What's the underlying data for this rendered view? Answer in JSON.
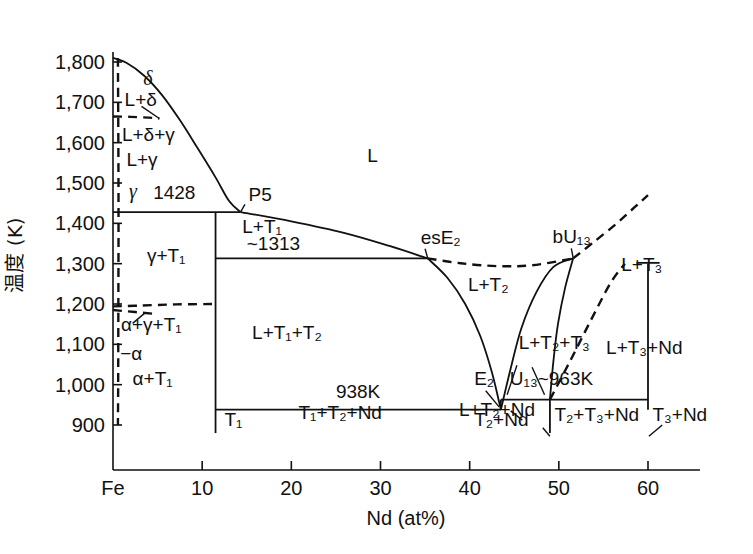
{
  "figure": {
    "kind": "binary-phase-diagram",
    "system": "Fe-Nd"
  },
  "axes": {
    "y": {
      "title": "温度 (K)",
      "unit": "K",
      "ticks": [
        900,
        1000,
        1100,
        1200,
        1300,
        1400,
        1500,
        1600,
        1700,
        1800
      ],
      "tick_labels": [
        "900",
        "1,000",
        "1,100",
        "1,200",
        "1,300",
        "1,400",
        "1,500",
        "1,600",
        "1,700",
        "1,800"
      ],
      "range": [
        855,
        1845
      ]
    },
    "x": {
      "title": "Nd (at%)",
      "ticks": [
        0,
        10,
        20,
        30,
        40,
        50,
        60
      ],
      "tick_labels": [
        "Fe",
        "10",
        "20",
        "30",
        "40",
        "50",
        "60"
      ],
      "range": [
        0,
        63.5
      ]
    }
  },
  "chart_data": {
    "type": "line",
    "xlabel": "Nd (at%)",
    "ylabel": "温度 (K)",
    "xlim": [
      0,
      63.5
    ],
    "ylim": [
      855,
      1845
    ],
    "grid": false,
    "legend": "none",
    "invariant_temperatures": [
      {
        "label": "1428",
        "value_K": 1428
      },
      {
        "label": "~1313",
        "value_K": 1313
      },
      {
        "label": "938K",
        "value_K": 938
      },
      {
        "label": "U13~963K",
        "value_K": 963
      }
    ],
    "invariant_points": [
      {
        "name": "P5",
        "x_at_pct": 14.3,
        "T_K": 1428
      },
      {
        "name": "esE2",
        "x_at_pct": 35.3,
        "T_K": 1313
      },
      {
        "name": "bU13",
        "x_at_pct": 51.6,
        "T_K": 1313
      },
      {
        "name": "E2",
        "x_at_pct": 43.5,
        "T_K": 938
      },
      {
        "name": "U13",
        "x_at_pct": 49.0,
        "T_K": 963
      }
    ],
    "series": [
      {
        "name": "liquidus-Fe-rich",
        "style": "solid",
        "points": [
          [
            0,
            1810
          ],
          [
            1.5,
            1798
          ],
          [
            3.5,
            1766
          ],
          [
            5.5,
            1718
          ],
          [
            7.5,
            1656
          ],
          [
            9.5,
            1586
          ],
          [
            11.5,
            1514
          ],
          [
            13.0,
            1456
          ],
          [
            14.3,
            1428
          ]
        ]
      },
      {
        "name": "liquidus-L+T1",
        "style": "solid",
        "points": [
          [
            14.3,
            1428
          ],
          [
            20,
            1405
          ],
          [
            26,
            1376
          ],
          [
            31,
            1344
          ],
          [
            35.3,
            1313
          ]
        ]
      },
      {
        "name": "liquidus-L+T2-left",
        "style": "solid",
        "points": [
          [
            35.3,
            1313
          ],
          [
            37.5,
            1265
          ],
          [
            39.5,
            1200
          ],
          [
            41.2,
            1120
          ],
          [
            42.5,
            1030
          ],
          [
            43.5,
            938
          ]
        ]
      },
      {
        "name": "liquidus-T2-right",
        "style": "solid",
        "points": [
          [
            43.5,
            938
          ],
          [
            44.6,
            1040
          ],
          [
            45.8,
            1140
          ],
          [
            47.5,
            1230
          ],
          [
            49.4,
            1292
          ],
          [
            51.6,
            1313
          ]
        ]
      },
      {
        "name": "T2-solvus-right",
        "style": "solid",
        "points": [
          [
            51.6,
            1313
          ],
          [
            50.7,
            1240
          ],
          [
            49.9,
            1150
          ],
          [
            49.4,
            1060
          ],
          [
            49.0,
            963
          ]
        ]
      },
      {
        "name": "solvus-esE2-bU13-dashed",
        "style": "dashed",
        "points": [
          [
            35.3,
            1313
          ],
          [
            39,
            1301
          ],
          [
            43,
            1294
          ],
          [
            47,
            1296
          ],
          [
            51.6,
            1313
          ]
        ]
      },
      {
        "name": "T3-liquidus-dashed",
        "style": "dashed",
        "points": [
          [
            51.6,
            1313
          ],
          [
            54,
            1355
          ],
          [
            56.5,
            1400
          ],
          [
            58.5,
            1440
          ],
          [
            60,
            1470
          ]
        ]
      },
      {
        "name": "T3-boundary-dashed",
        "style": "dashed",
        "points": [
          [
            49.0,
            963
          ],
          [
            51.3,
            1060
          ],
          [
            53.6,
            1160
          ],
          [
            55.8,
            1252
          ],
          [
            57.4,
            1300
          ]
        ]
      },
      {
        "name": "delta-gamma-dashed",
        "style": "dashed",
        "points": [
          [
            0,
            1665
          ],
          [
            2.0,
            1664
          ],
          [
            4.0,
            1662
          ],
          [
            5.2,
            1660
          ]
        ]
      },
      {
        "name": "alpha-gamma-dashed",
        "style": "dashed",
        "points": [
          [
            0,
            1194
          ],
          [
            3,
            1196
          ],
          [
            7,
            1199
          ],
          [
            11.5,
            1200
          ]
        ]
      },
      {
        "name": "alpha-gamma-T1-dashed",
        "style": "dashed",
        "points": [
          [
            0,
            1185
          ],
          [
            2.5,
            1180
          ],
          [
            4.5,
            1176
          ]
        ]
      },
      {
        "name": "Fe-solubility-dashed",
        "style": "dashed",
        "points": [
          [
            0.55,
            1810
          ],
          [
            0.6,
            1600
          ],
          [
            0.62,
            1400
          ],
          [
            0.6,
            1200
          ],
          [
            0.58,
            1000
          ],
          [
            0.55,
            900
          ]
        ]
      },
      {
        "name": "T3-vertical-solid",
        "style": "solid",
        "points": [
          [
            60,
            1300
          ],
          [
            60,
            938
          ]
        ]
      },
      {
        "name": "T1-vertical-solid",
        "style": "solid",
        "points": [
          [
            11.5,
            1428
          ],
          [
            11.5,
            880
          ]
        ]
      },
      {
        "name": "T2-vertical-solid",
        "style": "solid",
        "points": [
          [
            49.0,
            963
          ],
          [
            49.0,
            880
          ]
        ]
      },
      {
        "name": "horizontal-1428",
        "style": "solid",
        "points": [
          [
            0,
            1428
          ],
          [
            14.3,
            1428
          ]
        ]
      },
      {
        "name": "horizontal-1313",
        "style": "solid",
        "points": [
          [
            11.5,
            1313
          ],
          [
            35.3,
            1313
          ]
        ]
      },
      {
        "name": "horizontal-938",
        "style": "solid",
        "points": [
          [
            11.5,
            938
          ],
          [
            43.5,
            938
          ]
        ]
      },
      {
        "name": "horizontal-963",
        "style": "solid",
        "points": [
          [
            43.5,
            963
          ],
          [
            60,
            963
          ]
        ]
      }
    ]
  },
  "field_labels": [
    {
      "id": "delta",
      "text": "δ",
      "x_at_pct": 3.4,
      "T_K": 1742,
      "italic": true
    },
    {
      "id": "L-delta",
      "text": "L+δ",
      "x_at_pct": 1.3,
      "T_K": 1690,
      "italic": false
    },
    {
      "id": "L-delta-gamma",
      "text": "L+δ+γ",
      "x_at_pct": 1.0,
      "T_K": 1603,
      "italic": false
    },
    {
      "id": "L-gamma",
      "text": "L+γ",
      "x_at_pct": 1.5,
      "T_K": 1543,
      "italic": false
    },
    {
      "id": "gamma",
      "text": "γ",
      "x_at_pct": 1.8,
      "T_K": 1462,
      "italic": true
    },
    {
      "id": "temp-1428",
      "text": "1428",
      "x_at_pct": 4.5,
      "T_K": 1460,
      "italic": false
    },
    {
      "id": "P5",
      "text": "P5",
      "x_at_pct": 15.2,
      "T_K": 1455,
      "italic": false
    },
    {
      "id": "L",
      "text": "L",
      "x_at_pct": 28.5,
      "T_K": 1553,
      "italic": false
    },
    {
      "id": "gamma-T1",
      "text": "γ+T₁",
      "x_at_pct": 3.8,
      "T_K": 1305,
      "italic": false
    },
    {
      "id": "L-T1",
      "text": "L+T₁",
      "x_at_pct": 14.5,
      "T_K": 1377,
      "italic": false
    },
    {
      "id": "temp-1313",
      "text": "~1313",
      "x_at_pct": 15.0,
      "T_K": 1335,
      "italic": false
    },
    {
      "id": "esE2",
      "text": "esE₂",
      "x_at_pct": 34.5,
      "T_K": 1350,
      "italic": false
    },
    {
      "id": "bU13",
      "text": "bU₁₃",
      "x_at_pct": 49.3,
      "T_K": 1352,
      "italic": false
    },
    {
      "id": "L-T3",
      "text": "L+T₃",
      "x_at_pct": 57.0,
      "T_K": 1283,
      "italic": false
    },
    {
      "id": "L-T2",
      "text": "L+T₂",
      "x_at_pct": 39.8,
      "T_K": 1232,
      "italic": false
    },
    {
      "id": "alpha-gamma-T1",
      "text": "α+γ+T₁",
      "x_at_pct": 0.9,
      "T_K": 1133,
      "italic": false
    },
    {
      "id": "alpha",
      "text": "−α",
      "x_at_pct": 0.8,
      "T_K": 1062,
      "italic": false
    },
    {
      "id": "alpha-T1",
      "text": "α+T₁",
      "x_at_pct": 2.2,
      "T_K": 1000,
      "italic": false
    },
    {
      "id": "L-T1-T2",
      "text": "L+T₁+T₂",
      "x_at_pct": 15.6,
      "T_K": 1113,
      "italic": false
    },
    {
      "id": "L-T2-T3",
      "text": "L+T₂+T₃",
      "x_at_pct": 45.5,
      "T_K": 1088,
      "italic": false
    },
    {
      "id": "L-T3-Nd",
      "text": "L+T₃+Nd",
      "x_at_pct": 55.3,
      "T_K": 1075,
      "italic": false
    },
    {
      "id": "temp-938",
      "text": "938K",
      "x_at_pct": 25.0,
      "T_K": 968,
      "italic": false
    },
    {
      "id": "E2",
      "text": "E₂",
      "x_at_pct": 40.5,
      "T_K": 1000,
      "italic": false
    },
    {
      "id": "U13-963",
      "text": "U₁₃~963K",
      "x_at_pct": 44.5,
      "T_K": 1000,
      "italic": false
    },
    {
      "id": "T1",
      "text": "T₁",
      "x_at_pct": 12.5,
      "T_K": 898,
      "italic": false
    },
    {
      "id": "T1-T2-Nd",
      "text": "T₁+T₂+Nd",
      "x_at_pct": 20.8,
      "T_K": 915,
      "italic": false
    },
    {
      "id": "L-T2-Nd",
      "text": "L+T₂+Nd",
      "x_at_pct": 38.8,
      "T_K": 922,
      "italic": false
    },
    {
      "id": "T2-Nd",
      "text": "T₂+Nd",
      "x_at_pct": 40.5,
      "T_K": 898,
      "italic": false
    },
    {
      "id": "T2-T3-Nd",
      "text": "T₂+T₃+Nd",
      "x_at_pct": 49.5,
      "T_K": 910,
      "italic": false
    },
    {
      "id": "T3-Nd",
      "text": "T₃+Nd",
      "x_at_pct": 60.5,
      "T_K": 910,
      "italic": false
    }
  ],
  "colors": {
    "line": "#111111",
    "text": "#111111",
    "background": "#ffffff"
  }
}
